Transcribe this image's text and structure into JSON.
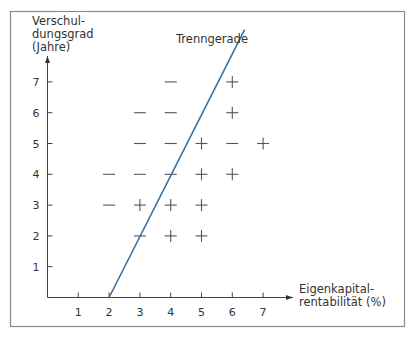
{
  "chart_data": {
    "type": "scatter",
    "title": "",
    "xlabel": "Eigenkapital-\nrentabilität (%)",
    "xlabel_lines": [
      "Eigenkapital-",
      "rentabilität (%)"
    ],
    "ylabel": "Verschul-\ndungsgrad\n(Jahre)",
    "ylabel_lines": [
      "Verschul-",
      "dungsgrad",
      "(Jahre)"
    ],
    "xlim": [
      0,
      7.5
    ],
    "ylim": [
      0,
      7.5
    ],
    "x_ticks": [
      1,
      2,
      3,
      4,
      5,
      6,
      7
    ],
    "y_ticks": [
      1,
      2,
      3,
      4,
      5,
      6,
      7
    ],
    "grid": false,
    "legend": null,
    "series": [
      {
        "name": "minus",
        "marker": "−",
        "points": [
          {
            "x": 4,
            "y": 7
          },
          {
            "x": 3,
            "y": 6
          },
          {
            "x": 4,
            "y": 6
          },
          {
            "x": 3,
            "y": 5
          },
          {
            "x": 4,
            "y": 5
          },
          {
            "x": 6,
            "y": 5
          },
          {
            "x": 2,
            "y": 4
          },
          {
            "x": 3,
            "y": 4
          },
          {
            "x": 4,
            "y": 4
          },
          {
            "x": 2,
            "y": 3
          },
          {
            "x": 3,
            "y": 2
          }
        ]
      },
      {
        "name": "plus",
        "marker": "+",
        "points": [
          {
            "x": 6,
            "y": 7
          },
          {
            "x": 6,
            "y": 6
          },
          {
            "x": 5,
            "y": 5
          },
          {
            "x": 7,
            "y": 5
          },
          {
            "x": 5,
            "y": 4
          },
          {
            "x": 6,
            "y": 4
          },
          {
            "x": 3,
            "y": 3
          },
          {
            "x": 4,
            "y": 3
          },
          {
            "x": 5,
            "y": 3
          },
          {
            "x": 4,
            "y": 2
          },
          {
            "x": 5,
            "y": 2
          }
        ]
      }
    ],
    "annotations": [
      {
        "type": "line",
        "label": "Trenngerade",
        "from": {
          "x": 2,
          "y": 0
        },
        "to": {
          "x": 6.4,
          "y": 8.7
        },
        "color": "#3a6f9e"
      }
    ]
  },
  "colors": {
    "separator_line": "#3a6f9e",
    "axis": "#444444",
    "marker": "#555555",
    "frame": "#888888"
  }
}
